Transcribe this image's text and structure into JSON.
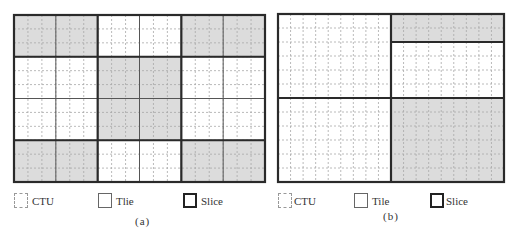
{
  "colors": {
    "shade": "#dcdcdc",
    "ctu_line": "#a8a8a8",
    "tile_line": "#555555",
    "slice_line": "#2a2a2a"
  },
  "legend": {
    "ctu_label": "CTU",
    "tile_label": "Tile",
    "tile_label_a": "Tlie",
    "slice_label": "Slice"
  },
  "panels": [
    {
      "id": "a",
      "caption": "(a)",
      "cols": 18,
      "rows": 12,
      "tile_cols": [
        3,
        6,
        9,
        12,
        15
      ],
      "tile_rows": [
        3,
        6,
        9
      ],
      "slice_v_segments": [
        {
          "col": 6,
          "from_row": 0,
          "to_row": 12
        },
        {
          "col": 12,
          "from_row": 0,
          "to_row": 12
        }
      ],
      "slice_h_segments": [
        {
          "row": 3,
          "from_col": 0,
          "to_col": 18
        },
        {
          "row": 9,
          "from_col": 0,
          "to_col": 18
        }
      ],
      "shaded_regions": [
        {
          "c0": 0,
          "r0": 0,
          "c1": 6,
          "r1": 3
        },
        {
          "c0": 12,
          "r0": 0,
          "c1": 18,
          "r1": 3
        },
        {
          "c0": 6,
          "r0": 3,
          "c1": 12,
          "r1": 9
        },
        {
          "c0": 0,
          "r0": 9,
          "c1": 6,
          "r1": 12
        },
        {
          "c0": 12,
          "r0": 9,
          "c1": 18,
          "r1": 12
        }
      ]
    },
    {
      "id": "b",
      "caption": "(b)",
      "cols": 18,
      "rows": 12,
      "tile_cols": [
        9
      ],
      "tile_rows": [],
      "slice_v_segments": [
        {
          "col": 9,
          "from_row": 0,
          "to_row": 12
        }
      ],
      "slice_h_segments": [
        {
          "row": 2,
          "from_col": 9,
          "to_col": 18
        },
        {
          "row": 6,
          "from_col": 0,
          "to_col": 18
        }
      ],
      "shaded_regions": [
        {
          "c0": 9,
          "r0": 0,
          "c1": 18,
          "r1": 2
        },
        {
          "c0": 9,
          "r0": 6,
          "c1": 18,
          "r1": 12
        }
      ]
    }
  ]
}
